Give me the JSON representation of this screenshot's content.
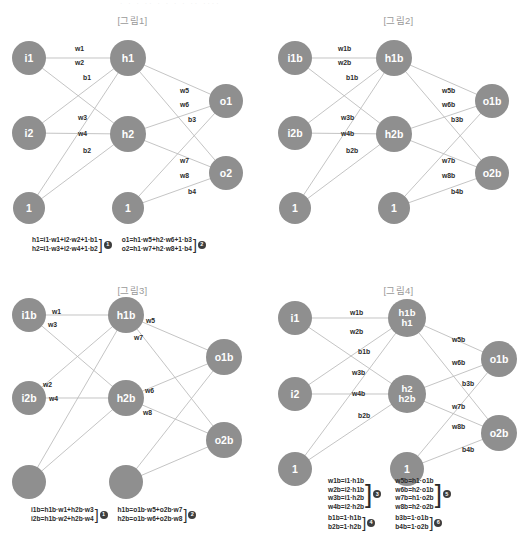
{
  "page": {
    "ghost_text": "· · ·  ·· ·   · ·  ·  ··  ····"
  },
  "figures": [
    {
      "id": "fig1",
      "title": "[그림1]",
      "nodes": [
        {
          "name": "input-1",
          "label": "i1",
          "x": 29,
          "y": 58,
          "r": 17
        },
        {
          "name": "input-2",
          "label": "i2",
          "x": 29,
          "y": 133,
          "r": 17
        },
        {
          "name": "input-bias",
          "label": "1",
          "x": 29,
          "y": 208,
          "r": 16
        },
        {
          "name": "hidden-1",
          "label": "h1",
          "x": 128,
          "y": 58,
          "r": 18
        },
        {
          "name": "hidden-2",
          "label": "h2",
          "x": 128,
          "y": 134,
          "r": 18
        },
        {
          "name": "hidden-bias",
          "label": "1",
          "x": 128,
          "y": 208,
          "r": 16
        },
        {
          "name": "output-1",
          "label": "o1",
          "x": 226,
          "y": 101,
          "r": 17
        },
        {
          "name": "output-2",
          "label": "o2",
          "x": 226,
          "y": 173,
          "r": 17
        }
      ],
      "edges": [
        [
          29,
          58,
          128,
          58
        ],
        [
          29,
          58,
          128,
          134
        ],
        [
          29,
          133,
          128,
          58
        ],
        [
          29,
          133,
          128,
          134
        ],
        [
          29,
          208,
          128,
          58
        ],
        [
          29,
          208,
          128,
          134
        ],
        [
          128,
          58,
          226,
          101
        ],
        [
          128,
          58,
          226,
          173
        ],
        [
          128,
          134,
          226,
          101
        ],
        [
          128,
          134,
          226,
          173
        ],
        [
          128,
          208,
          226,
          101
        ],
        [
          128,
          208,
          226,
          173
        ]
      ],
      "edge_labels": [
        {
          "text": "w1",
          "x": 75,
          "y": 45
        },
        {
          "text": "w2",
          "x": 75,
          "y": 59
        },
        {
          "text": "b1",
          "x": 83,
          "y": 74
        },
        {
          "text": "w3",
          "x": 78,
          "y": 114
        },
        {
          "text": "w4",
          "x": 78,
          "y": 130
        },
        {
          "text": "b2",
          "x": 83,
          "y": 147
        },
        {
          "text": "w5",
          "x": 180,
          "y": 87
        },
        {
          "text": "w6",
          "x": 180,
          "y": 101
        },
        {
          "text": "b3",
          "x": 188,
          "y": 116
        },
        {
          "text": "w7",
          "x": 180,
          "y": 157
        },
        {
          "text": "w8",
          "x": 180,
          "y": 172
        },
        {
          "text": "b4",
          "x": 188,
          "y": 188
        }
      ],
      "formula_groups": [
        {
          "lines": [
            "h1=i1·w1+i2·w2+1·b1",
            "h2=i1·w3+i2·w4+1·b2"
          ],
          "badge": "1"
        },
        {
          "lines": [
            "o1=h1·w5+h2·w6+1·b3",
            "o2=h1·w7+h2·w8+1·b4"
          ],
          "badge": "2"
        }
      ]
    },
    {
      "id": "fig2",
      "title": "[그림2]",
      "nodes": [
        {
          "name": "input-1",
          "label": "i1b",
          "x": 29,
          "y": 58,
          "r": 17
        },
        {
          "name": "input-2",
          "label": "i2b",
          "x": 29,
          "y": 133,
          "r": 17
        },
        {
          "name": "input-bias",
          "label": "1",
          "x": 29,
          "y": 208,
          "r": 16
        },
        {
          "name": "hidden-1",
          "label": "h1b",
          "x": 128,
          "y": 58,
          "r": 18
        },
        {
          "name": "hidden-2",
          "label": "h2b",
          "x": 128,
          "y": 134,
          "r": 18
        },
        {
          "name": "hidden-bias",
          "label": "1",
          "x": 128,
          "y": 208,
          "r": 16
        },
        {
          "name": "output-1",
          "label": "o1b",
          "x": 226,
          "y": 101,
          "r": 17
        },
        {
          "name": "output-2",
          "label": "o2b",
          "x": 226,
          "y": 173,
          "r": 17
        }
      ],
      "edges": [
        [
          29,
          58,
          128,
          58
        ],
        [
          29,
          58,
          128,
          134
        ],
        [
          29,
          133,
          128,
          58
        ],
        [
          29,
          133,
          128,
          134
        ],
        [
          29,
          208,
          128,
          58
        ],
        [
          29,
          208,
          128,
          134
        ],
        [
          128,
          58,
          226,
          101
        ],
        [
          128,
          58,
          226,
          173
        ],
        [
          128,
          134,
          226,
          101
        ],
        [
          128,
          134,
          226,
          173
        ],
        [
          128,
          208,
          226,
          101
        ],
        [
          128,
          208,
          226,
          173
        ]
      ],
      "edge_labels": [
        {
          "text": "w1b",
          "x": 72,
          "y": 45
        },
        {
          "text": "w2b",
          "x": 72,
          "y": 59
        },
        {
          "text": "b1b",
          "x": 80,
          "y": 74
        },
        {
          "text": "w3b",
          "x": 75,
          "y": 114
        },
        {
          "text": "w4b",
          "x": 75,
          "y": 130
        },
        {
          "text": "b2b",
          "x": 80,
          "y": 147
        },
        {
          "text": "w5b",
          "x": 176,
          "y": 87
        },
        {
          "text": "w6b",
          "x": 176,
          "y": 101
        },
        {
          "text": "b3b",
          "x": 185,
          "y": 116
        },
        {
          "text": "w7b",
          "x": 176,
          "y": 157
        },
        {
          "text": "w8b",
          "x": 176,
          "y": 172
        },
        {
          "text": "b4b",
          "x": 185,
          "y": 188
        }
      ],
      "formula_groups": []
    },
    {
      "id": "fig3",
      "title": "[그림3]",
      "nodes": [
        {
          "name": "input-1",
          "label": "i1b",
          "x": 29,
          "y": 45,
          "r": 17
        },
        {
          "name": "input-2",
          "label": "i2b",
          "x": 29,
          "y": 128,
          "r": 17
        },
        {
          "name": "input-bias",
          "label": "",
          "x": 29,
          "y": 212,
          "r": 17
        },
        {
          "name": "hidden-1",
          "label": "h1b",
          "x": 126,
          "y": 45,
          "r": 18
        },
        {
          "name": "hidden-2",
          "label": "h2b",
          "x": 126,
          "y": 128,
          "r": 18
        },
        {
          "name": "hidden-bias",
          "label": "",
          "x": 126,
          "y": 212,
          "r": 17
        },
        {
          "name": "output-1",
          "label": "o1b",
          "x": 224,
          "y": 87,
          "r": 18
        },
        {
          "name": "output-2",
          "label": "o2b",
          "x": 224,
          "y": 170,
          "r": 18
        }
      ],
      "edges": [
        [
          29,
          45,
          126,
          45
        ],
        [
          29,
          45,
          126,
          128
        ],
        [
          29,
          128,
          126,
          45
        ],
        [
          29,
          128,
          126,
          128
        ],
        [
          29,
          212,
          126,
          45
        ],
        [
          29,
          212,
          126,
          128
        ],
        [
          126,
          45,
          224,
          87
        ],
        [
          126,
          45,
          224,
          170
        ],
        [
          126,
          128,
          224,
          87
        ],
        [
          126,
          128,
          224,
          170
        ],
        [
          126,
          212,
          224,
          87
        ],
        [
          126,
          212,
          224,
          170
        ]
      ],
      "edge_labels": [
        {
          "text": "w1",
          "x": 52,
          "y": 38
        },
        {
          "text": "w3",
          "x": 48,
          "y": 51
        },
        {
          "text": "w2",
          "x": 43,
          "y": 111
        },
        {
          "text": "w4",
          "x": 49,
          "y": 125
        },
        {
          "text": "w5",
          "x": 146,
          "y": 47
        },
        {
          "text": "w7",
          "x": 134,
          "y": 64
        },
        {
          "text": "w6",
          "x": 145,
          "y": 117
        },
        {
          "text": "w8",
          "x": 143,
          "y": 139
        }
      ],
      "formula_groups": [
        {
          "lines": [
            "i1b=h1b·w1+h2b·w3",
            "i2b=h1b·w2+h2b·w4"
          ],
          "badge": "1"
        },
        {
          "lines": [
            "h1b=o1b·w5+o2b·w7",
            "h2b=o1b·w6+o2b·w8"
          ],
          "badge": "2"
        }
      ]
    },
    {
      "id": "fig4",
      "title": "[그림4]",
      "nodes": [
        {
          "name": "input-1",
          "label": "i1",
          "x": 29,
          "y": 48,
          "r": 17
        },
        {
          "name": "input-2",
          "label": "i2",
          "x": 29,
          "y": 124,
          "r": 17
        },
        {
          "name": "input-bias",
          "label": "1",
          "x": 29,
          "y": 199,
          "r": 17
        },
        {
          "name": "hidden-1",
          "label": "h1b",
          "label2": "h1",
          "x": 141,
          "y": 48,
          "r": 19
        },
        {
          "name": "hidden-2",
          "label": "h2",
          "label2": "h2b",
          "x": 141,
          "y": 124,
          "r": 19
        },
        {
          "name": "hidden-bias",
          "label": "1",
          "x": 141,
          "y": 199,
          "r": 17
        },
        {
          "name": "output-1",
          "label": "o1b",
          "x": 233,
          "y": 89,
          "r": 18
        },
        {
          "name": "output-2",
          "label": "o2b",
          "x": 233,
          "y": 163,
          "r": 18
        }
      ],
      "edges": [
        [
          29,
          48,
          141,
          48
        ],
        [
          29,
          48,
          141,
          124
        ],
        [
          29,
          124,
          141,
          48
        ],
        [
          29,
          124,
          141,
          124
        ],
        [
          29,
          199,
          141,
          48
        ],
        [
          29,
          199,
          141,
          124
        ],
        [
          141,
          48,
          233,
          89
        ],
        [
          141,
          48,
          233,
          163
        ],
        [
          141,
          124,
          233,
          89
        ],
        [
          141,
          124,
          233,
          163
        ],
        [
          141,
          199,
          233,
          89
        ],
        [
          141,
          199,
          233,
          163
        ]
      ],
      "edge_labels": [
        {
          "text": "w1b",
          "x": 84,
          "y": 39
        },
        {
          "text": "w2b",
          "x": 84,
          "y": 58
        },
        {
          "text": "b1b",
          "x": 92,
          "y": 78
        },
        {
          "text": "w3b",
          "x": 86,
          "y": 99
        },
        {
          "text": "w4b",
          "x": 86,
          "y": 120
        },
        {
          "text": "b2b",
          "x": 92,
          "y": 142
        },
        {
          "text": "w5b",
          "x": 186,
          "y": 66
        },
        {
          "text": "w6b",
          "x": 186,
          "y": 89
        },
        {
          "text": "b3b",
          "x": 196,
          "y": 110
        },
        {
          "text": "w7b",
          "x": 186,
          "y": 133
        },
        {
          "text": "w8b",
          "x": 186,
          "y": 153
        },
        {
          "text": "b4b",
          "x": 196,
          "y": 176
        }
      ],
      "formula_groups": [
        {
          "lines": [
            "w1b=i1·h1b",
            "w2b=i2·h1b",
            "w3b=i1·h2b",
            "w4b=i2·h2b"
          ],
          "badge": "3"
        },
        {
          "lines": [
            "b1b=1·h1b",
            "b2b=1·h2b"
          ],
          "badge": "4"
        },
        {
          "lines": [
            "w5b=h1·o1b",
            "w6b=h2·o1b",
            "w7b=h1·o2b",
            "w8b=h2·o2b"
          ],
          "badge": "5"
        },
        {
          "lines": [
            "b3b=1·o1b",
            "b4b=1·o2b"
          ],
          "badge": "6"
        }
      ]
    }
  ]
}
